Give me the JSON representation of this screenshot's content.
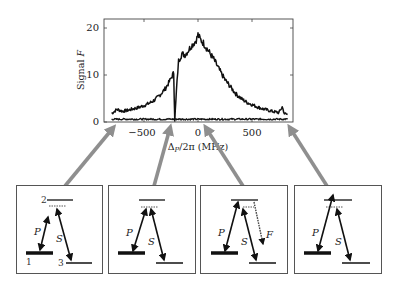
{
  "chart_data": {
    "type": "line",
    "title": "",
    "xlabel": "Δ_P/2π (MHz)",
    "ylabel": "Signal F",
    "xlim": [
      -800,
      850
    ],
    "ylim": [
      0,
      22
    ],
    "xticks": [
      -500,
      0,
      500
    ],
    "yticks": [
      0,
      10,
      20
    ],
    "xtick_labels": [
      "−500",
      "0",
      "500"
    ],
    "ytick_labels": [
      "0",
      "10",
      "20"
    ],
    "grid": false,
    "legend": null,
    "series": [
      {
        "name": "Signal",
        "x": [
          -800,
          -750,
          -700,
          -650,
          -600,
          -550,
          -500,
          -450,
          -400,
          -350,
          -300,
          -260,
          -240,
          -225,
          -215,
          -200,
          -180,
          -150,
          -120,
          -90,
          -60,
          -30,
          -10,
          0,
          20,
          50,
          100,
          150,
          200,
          250,
          300,
          350,
          400,
          450,
          500,
          550,
          600,
          650,
          700,
          750,
          780,
          800,
          830
        ],
        "y": [
          1.8,
          2.7,
          2.3,
          2.5,
          2.8,
          3.1,
          3.5,
          4.0,
          4.7,
          5.8,
          7.2,
          8.8,
          9.8,
          10.5,
          0.4,
          6.5,
          13.0,
          14.5,
          14.3,
          15.2,
          16.3,
          17.0,
          17.8,
          18.6,
          17.6,
          16.8,
          15.0,
          13.2,
          11.0,
          9.0,
          7.5,
          6.0,
          5.0,
          4.2,
          3.7,
          3.2,
          2.8,
          2.5,
          2.2,
          2.0,
          3.2,
          1.8,
          1.6
        ]
      },
      {
        "name": "Baseline",
        "x": [
          -800,
          830
        ],
        "y": [
          0.6,
          0.6
        ]
      }
    ],
    "annotations": [
      {
        "points_to_x": -720,
        "panel": 1
      },
      {
        "points_to_x": -240,
        "panel": 2
      },
      {
        "points_to_x": 0,
        "panel": 3
      },
      {
        "points_to_x": 790,
        "panel": 4
      }
    ]
  },
  "axes": {
    "xlabel": "Δ",
    "xlabel_sub": "P",
    "xlabel_rest": "/2π (MHz)",
    "ylabel": "Signal ",
    "ylabel_italic": "F",
    "xtick_labels": [
      "−500",
      "0",
      "500"
    ],
    "ytick_labels": [
      "0",
      "10",
      "20"
    ]
  },
  "panels": [
    {
      "levels": {
        "top": "2",
        "ground": "1",
        "final": "3"
      },
      "beams": {
        "pump": "P",
        "stokes": "S"
      }
    },
    {
      "beams": {
        "pump": "P",
        "stokes": "S"
      }
    },
    {
      "beams": {
        "pump": "P",
        "stokes": "S",
        "fluorescence": "F"
      }
    },
    {
      "beams": {
        "pump": "P",
        "stokes": "S"
      }
    }
  ],
  "colors": {
    "trace": "#111111",
    "arrow": "#8f8f8f",
    "frame": "#444444"
  }
}
